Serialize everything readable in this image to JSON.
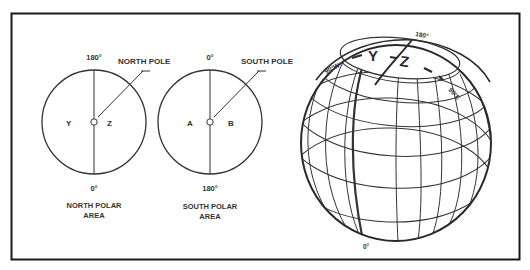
{
  "north_polar": {
    "top_label": "180°",
    "bottom_label": "0°",
    "pole_label": "NORTH POLE",
    "left_letter": "Y",
    "right_letter": "Z",
    "caption_line1": "NORTH POLAR",
    "caption_line2": "AREA"
  },
  "south_polar": {
    "top_label": "0°",
    "bottom_label": "180°",
    "pole_label": "SOUTH POLE",
    "left_letter": "A",
    "right_letter": "B",
    "caption_line1": "SOUTH POLAR",
    "caption_line2": "AREA"
  },
  "globe": {
    "top_label": "180°",
    "bottom_label": "0°",
    "west_label": "90°W",
    "east_label": "90°E",
    "letter_y": "Y",
    "letter_z": "Z"
  },
  "colors": {
    "line": "#333333",
    "frame": "#1a1a1a",
    "background": "#ffffff"
  }
}
